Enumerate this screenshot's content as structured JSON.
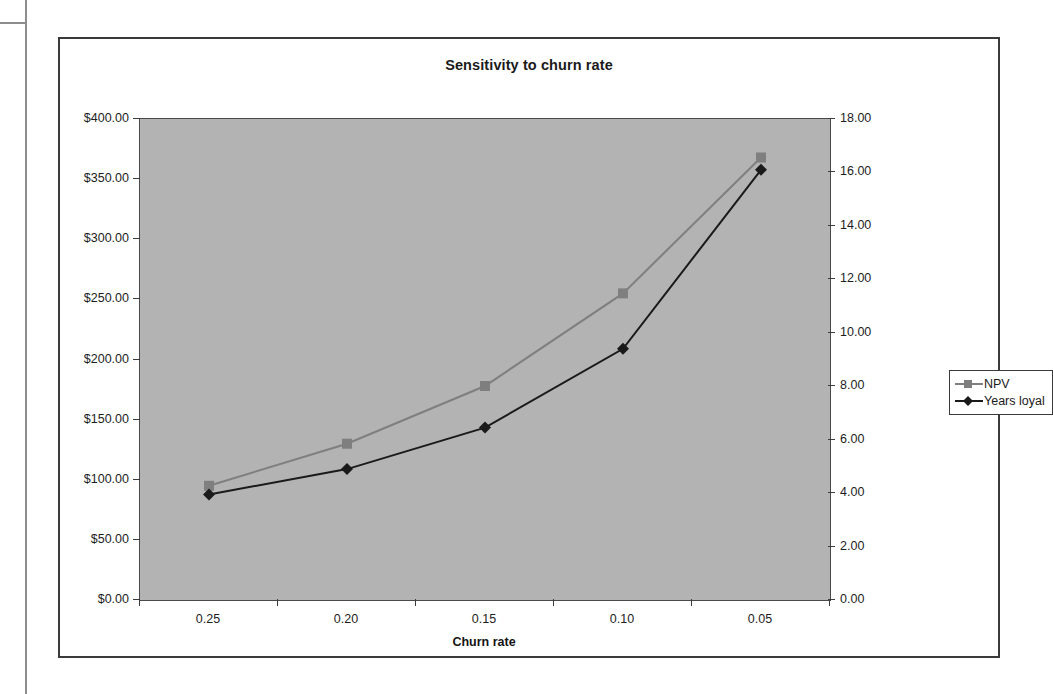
{
  "chart": {
    "title": "Sensitivity to churn rate",
    "plot_bg_color": "#b3b3b3",
    "border_color": "#3a3a3a"
  },
  "legend": {
    "position": "right",
    "items": [
      {
        "label": "NPV",
        "color": "#7f7f7f",
        "marker": "square"
      },
      {
        "label": "Years loyal",
        "color": "#1a1a1a",
        "marker": "diamond"
      }
    ]
  },
  "axes": {
    "x": {
      "label": "Churn rate",
      "ticks": [
        "0.25",
        "0.20",
        "0.15",
        "0.10",
        "0.05"
      ]
    },
    "y_left": {
      "label": "",
      "ticks": [
        "$0.00",
        "$50.00",
        "$100.00",
        "$150.00",
        "$200.00",
        "$250.00",
        "$300.00",
        "$350.00",
        "$400.00"
      ]
    },
    "y_right": {
      "label": "",
      "ticks": [
        "0.00",
        "2.00",
        "4.00",
        "6.00",
        "8.00",
        "10.00",
        "12.00",
        "14.00",
        "16.00",
        "18.00"
      ]
    }
  },
  "chart_data": {
    "type": "line",
    "title": "Sensitivity to churn rate",
    "xlabel": "Churn rate",
    "ylabel": "",
    "categories": [
      "0.25",
      "0.20",
      "0.15",
      "0.10",
      "0.05"
    ],
    "x": [
      0.25,
      0.2,
      0.15,
      0.1,
      0.05
    ],
    "grid": false,
    "legend_position": "right",
    "series": [
      {
        "name": "NPV",
        "axis": "left",
        "color": "#7f7f7f",
        "marker": "square",
        "values": [
          95,
          130,
          178,
          255,
          368
        ],
        "ylim": [
          0,
          400
        ],
        "ytick_step": 50,
        "ytick_format": "$0.00"
      },
      {
        "name": "Years loyal",
        "axis": "right",
        "color": "#1a1a1a",
        "marker": "diamond",
        "values": [
          3.95,
          4.9,
          6.45,
          9.4,
          16.1
        ],
        "ylim": [
          0,
          18
        ],
        "ytick_step": 2,
        "ytick_format": "0.00"
      }
    ]
  }
}
